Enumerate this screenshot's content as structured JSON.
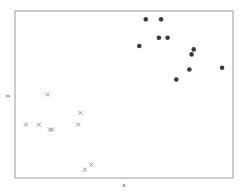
{
  "chart_data": {
    "type": "scatter",
    "title": "",
    "xlabel": "x",
    "ylabel": "y",
    "xlim": [
      0,
      1
    ],
    "ylim": [
      0,
      1
    ],
    "grid": false,
    "ticks": false,
    "legend": null,
    "series": [
      {
        "name": "class-circle",
        "marker": "circle",
        "color": "#3a3a3a",
        "points": [
          {
            "x": 0.6,
            "y": 0.95
          },
          {
            "x": 0.67,
            "y": 0.95
          },
          {
            "x": 0.66,
            "y": 0.84
          },
          {
            "x": 0.7,
            "y": 0.84
          },
          {
            "x": 0.57,
            "y": 0.79
          },
          {
            "x": 0.82,
            "y": 0.77
          },
          {
            "x": 0.81,
            "y": 0.74
          },
          {
            "x": 0.8,
            "y": 0.65
          },
          {
            "x": 0.95,
            "y": 0.66
          },
          {
            "x": 0.74,
            "y": 0.59
          }
        ]
      },
      {
        "name": "class-cross",
        "marker": "x",
        "color": "#8a8a8a",
        "points": [
          {
            "x": 0.15,
            "y": 0.5
          },
          {
            "x": 0.05,
            "y": 0.32
          },
          {
            "x": 0.11,
            "y": 0.32
          },
          {
            "x": 0.16,
            "y": 0.29
          },
          {
            "x": 0.17,
            "y": 0.29
          },
          {
            "x": 0.3,
            "y": 0.39
          },
          {
            "x": 0.29,
            "y": 0.32
          },
          {
            "x": 0.35,
            "y": 0.08
          },
          {
            "x": 0.32,
            "y": 0.05
          }
        ]
      }
    ]
  },
  "colors": {
    "frame": "#9a9a9a",
    "background": "#ffffff"
  }
}
